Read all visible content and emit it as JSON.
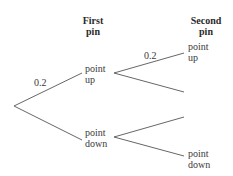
{
  "headers": {
    "first": "First\npin",
    "second": "Second\npin"
  },
  "nodes": {
    "first_up": "point\nup",
    "first_down": "point\ndown",
    "second_up": "point\nup",
    "second_down": "point\ndown"
  },
  "probabilities": {
    "first_up": "0.2",
    "second_up_given_up": "0.2"
  },
  "colors": {
    "line": "#555555",
    "text": "#3a3a3a"
  }
}
